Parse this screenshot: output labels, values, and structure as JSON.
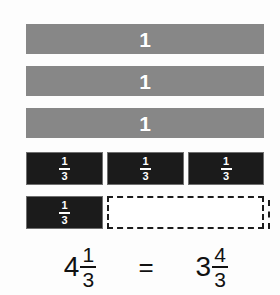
{
  "figure": {
    "colors": {
      "whole_bar_fill": "#878787",
      "whole_bar_label": "#ffffff",
      "third_filled_fill": "#1b1b1b",
      "third_empty_fill": "#ffffff",
      "outline": "#1b1b1b",
      "text": "#111111",
      "background": "#fdfdfd"
    }
  },
  "whole_bars": [
    {
      "label": "1"
    },
    {
      "label": "1"
    },
    {
      "label": "1"
    }
  ],
  "thirds_rows": [
    {
      "name": "full-thirds-row",
      "segments": [
        {
          "state": "filled",
          "numerator": "1",
          "denominator": "3"
        },
        {
          "state": "filled",
          "numerator": "1",
          "denominator": "3"
        },
        {
          "state": "filled",
          "numerator": "1",
          "denominator": "3"
        }
      ]
    },
    {
      "name": "partial-thirds-row",
      "segments": [
        {
          "state": "filled",
          "numerator": "1",
          "denominator": "3"
        },
        {
          "state": "empty",
          "numerator": "",
          "denominator": ""
        },
        {
          "state": "empty",
          "numerator": "",
          "denominator": ""
        }
      ]
    }
  ],
  "equation": {
    "left": {
      "whole": "4",
      "numerator": "1",
      "denominator": "3"
    },
    "operator": "=",
    "right": {
      "whole": "3",
      "numerator": "4",
      "denominator": "3"
    }
  }
}
